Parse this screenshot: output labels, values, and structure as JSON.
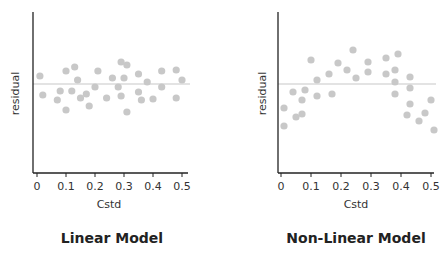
{
  "chart_data": [
    {
      "type": "scatter",
      "title": "Linear Model",
      "xlabel": "Cstd",
      "ylabel": "residual",
      "xlim": [
        0,
        0.5
      ],
      "xticks": [
        "0",
        "0.1",
        "0.2",
        "0.3",
        "0.4",
        "0.5"
      ],
      "reference_line": 0,
      "grid": false,
      "point_color": "#c8c8c8",
      "line_color": "#c8c8c8",
      "points": [
        {
          "x": 0.01,
          "y": 8
        },
        {
          "x": 0.02,
          "y": -11
        },
        {
          "x": 0.07,
          "y": -16
        },
        {
          "x": 0.08,
          "y": -7
        },
        {
          "x": 0.1,
          "y": 13
        },
        {
          "x": 0.1,
          "y": -26
        },
        {
          "x": 0.12,
          "y": -7
        },
        {
          "x": 0.13,
          "y": 17
        },
        {
          "x": 0.14,
          "y": 4
        },
        {
          "x": 0.15,
          "y": -14
        },
        {
          "x": 0.17,
          "y": -10
        },
        {
          "x": 0.18,
          "y": -22
        },
        {
          "x": 0.2,
          "y": -3
        },
        {
          "x": 0.21,
          "y": 13
        },
        {
          "x": 0.24,
          "y": -14
        },
        {
          "x": 0.26,
          "y": 6
        },
        {
          "x": 0.28,
          "y": -3
        },
        {
          "x": 0.29,
          "y": 22
        },
        {
          "x": 0.29,
          "y": -12
        },
        {
          "x": 0.3,
          "y": 6
        },
        {
          "x": 0.31,
          "y": 19
        },
        {
          "x": 0.31,
          "y": -28
        },
        {
          "x": 0.35,
          "y": 10
        },
        {
          "x": 0.35,
          "y": -8
        },
        {
          "x": 0.36,
          "y": -16
        },
        {
          "x": 0.38,
          "y": 2
        },
        {
          "x": 0.4,
          "y": -15
        },
        {
          "x": 0.43,
          "y": 13
        },
        {
          "x": 0.43,
          "y": -3
        },
        {
          "x": 0.48,
          "y": 14
        },
        {
          "x": 0.48,
          "y": -14
        },
        {
          "x": 0.5,
          "y": 4
        }
      ]
    },
    {
      "type": "scatter",
      "title": "Non-Linear Model",
      "xlabel": "Cstd",
      "ylabel": "residual",
      "xlim": [
        0,
        0.5
      ],
      "xticks": [
        "0",
        "0.1",
        "0.2",
        "0.3",
        "0.4",
        "0.5"
      ],
      "reference_line": 0,
      "grid": false,
      "point_color": "#c8c8c8",
      "line_color": "#c8c8c8",
      "points": [
        {
          "x": 0.01,
          "y": -24
        },
        {
          "x": 0.01,
          "y": -42
        },
        {
          "x": 0.04,
          "y": -8
        },
        {
          "x": 0.05,
          "y": -33
        },
        {
          "x": 0.07,
          "y": -16
        },
        {
          "x": 0.07,
          "y": -30
        },
        {
          "x": 0.08,
          "y": -6
        },
        {
          "x": 0.1,
          "y": 24
        },
        {
          "x": 0.12,
          "y": 4
        },
        {
          "x": 0.12,
          "y": -12
        },
        {
          "x": 0.16,
          "y": 10
        },
        {
          "x": 0.17,
          "y": -10
        },
        {
          "x": 0.19,
          "y": 21
        },
        {
          "x": 0.22,
          "y": 14
        },
        {
          "x": 0.24,
          "y": 34
        },
        {
          "x": 0.25,
          "y": 6
        },
        {
          "x": 0.29,
          "y": 22
        },
        {
          "x": 0.29,
          "y": 12
        },
        {
          "x": 0.35,
          "y": 26
        },
        {
          "x": 0.35,
          "y": 10
        },
        {
          "x": 0.38,
          "y": 14
        },
        {
          "x": 0.38,
          "y": 2
        },
        {
          "x": 0.38,
          "y": -10
        },
        {
          "x": 0.39,
          "y": 30
        },
        {
          "x": 0.43,
          "y": 7
        },
        {
          "x": 0.43,
          "y": -4
        },
        {
          "x": 0.43,
          "y": -20
        },
        {
          "x": 0.42,
          "y": -31
        },
        {
          "x": 0.46,
          "y": -37
        },
        {
          "x": 0.48,
          "y": -29
        },
        {
          "x": 0.5,
          "y": -16
        },
        {
          "x": 0.51,
          "y": -46
        }
      ]
    }
  ],
  "panels": {
    "left": {
      "title": "Linear Model",
      "xlabel": "Cstd",
      "ylabel": "residual"
    },
    "right": {
      "title": "Non-Linear Model",
      "xlabel": "Cstd",
      "ylabel": "residual"
    }
  }
}
